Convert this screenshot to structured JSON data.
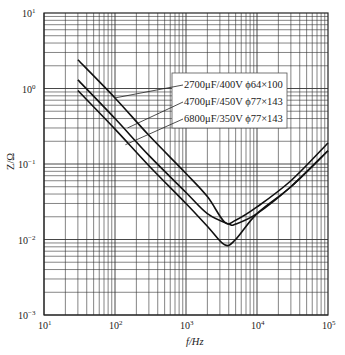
{
  "chart_data": {
    "type": "line",
    "title": "",
    "xlabel": "f/Hz",
    "ylabel": "Z/Ω",
    "xscale": "log",
    "yscale": "log",
    "xlim": [
      10,
      100000
    ],
    "ylim": [
      0.001,
      10
    ],
    "grid": true,
    "x_ticks": [
      "10^1",
      "10^2",
      "10^3",
      "10^4",
      "10^5"
    ],
    "y_ticks": [
      "10^-3",
      "10^-2",
      "10^-1",
      "10^0",
      "10^1"
    ],
    "legend_position": "upper-center-right box with leader lines",
    "series": [
      {
        "name": "2700μF/400V ϕ64×100",
        "x": [
          30,
          100,
          300,
          1000,
          2000,
          3500,
          5000,
          10000,
          30000,
          100000
        ],
        "y": [
          2.4,
          0.75,
          0.24,
          0.075,
          0.037,
          0.017,
          0.018,
          0.027,
          0.06,
          0.19
        ]
      },
      {
        "name": "4700μF/450V ϕ77×143",
        "x": [
          30,
          100,
          300,
          1000,
          2000,
          4000,
          5000,
          10000,
          30000,
          100000
        ],
        "y": [
          1.3,
          0.4,
          0.13,
          0.042,
          0.022,
          0.016,
          0.016,
          0.022,
          0.05,
          0.15
        ]
      },
      {
        "name": "6800μF/350V ϕ77×143",
        "x": [
          30,
          100,
          300,
          1000,
          2000,
          3500,
          5000,
          10000,
          30000,
          100000
        ],
        "y": [
          0.94,
          0.29,
          0.095,
          0.03,
          0.015,
          0.0085,
          0.01,
          0.022,
          0.05,
          0.15
        ]
      }
    ]
  },
  "labels": {
    "xlabel": "f/Hz",
    "ylabel": "Z/Ω",
    "legend": [
      "2700μF/400V ϕ64×100",
      "4700μF/450V ϕ77×143",
      "6800μF/350V ϕ77×143"
    ]
  }
}
